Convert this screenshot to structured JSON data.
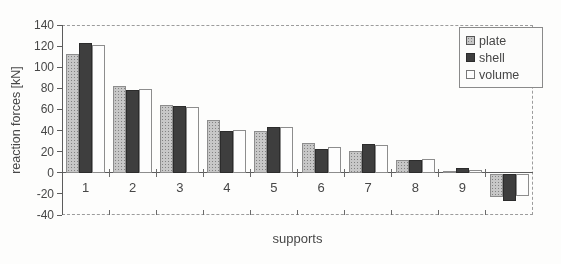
{
  "chart_data": {
    "type": "bar",
    "title": "",
    "xlabel": "supports",
    "ylabel": "reaction forces [kN]",
    "ylim": [
      -40,
      140
    ],
    "yticks": [
      140,
      120,
      100,
      80,
      60,
      40,
      20,
      0,
      -20,
      -40
    ],
    "categories": [
      "1",
      "2",
      "3",
      "4",
      "5",
      "6",
      "7",
      "8",
      "9",
      ""
    ],
    "series": [
      {
        "name": "plate",
        "color": "#c7c7c7",
        "values": [
          113,
          82,
          64,
          50,
          40,
          28,
          21,
          12,
          2,
          -22
        ]
      },
      {
        "name": "shell",
        "color": "#3e3e3e",
        "values": [
          123,
          78,
          63,
          40,
          43,
          23,
          27,
          12,
          5,
          -26
        ]
      },
      {
        "name": "volume",
        "color": "#fdfdfd",
        "values": [
          121,
          79,
          62,
          41,
          43,
          24,
          26,
          13,
          3,
          -21
        ]
      }
    ],
    "legend_position": "top-right",
    "grid": "dashed plot border only (top, right, bottom)"
  }
}
